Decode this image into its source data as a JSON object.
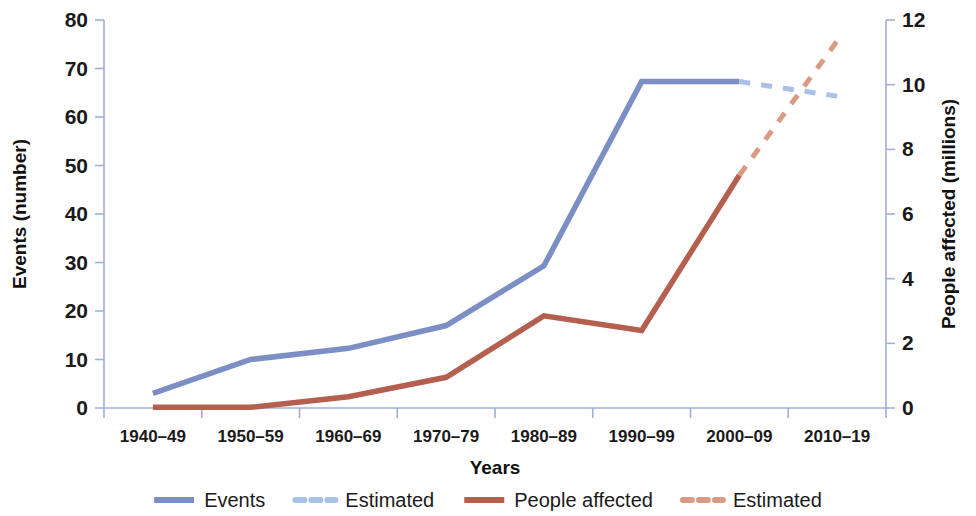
{
  "chart_data": {
    "type": "line",
    "title": "",
    "xlabel": "Years",
    "ylabel": "Events (number)",
    "y2label": "People affected (millions)",
    "categories": [
      "1940–49",
      "1950–59",
      "1960–69",
      "1970–79",
      "1980–89",
      "1990–99",
      "2000–09",
      "2010–19"
    ],
    "ylim": [
      0,
      80
    ],
    "yticks": [
      "0",
      "10",
      "20",
      "30",
      "40",
      "50",
      "60",
      "70",
      "80"
    ],
    "ytick_values": [
      0,
      10,
      20,
      30,
      40,
      50,
      60,
      70,
      80
    ],
    "y2lim": [
      0,
      12
    ],
    "y2ticks": [
      "0",
      "2",
      "4",
      "6",
      "8",
      "10",
      "12"
    ],
    "y2tick_values": [
      0,
      2,
      4,
      6,
      8,
      10,
      12
    ],
    "grid": false,
    "legend_position": "bottom",
    "series": [
      {
        "name": "Events",
        "axis": "left",
        "style": "solid",
        "color": "#7b8fc4",
        "x": [
          "1940–49",
          "1950–59",
          "1960–69",
          "1970–79",
          "1980–89",
          "1990–99",
          "2000–09"
        ],
        "values": [
          3,
          10,
          12.3,
          17,
          29.3,
          67.3,
          67.3
        ]
      },
      {
        "name": "Estimated",
        "axis": "left",
        "style": "dashed",
        "color": "#a9c1e6",
        "x": [
          "2000–09",
          "2010–19"
        ],
        "values": [
          67.3,
          64.3
        ]
      },
      {
        "name": "People affected",
        "axis": "right",
        "style": "solid",
        "color": "#b5604f",
        "x": [
          "1940–49",
          "1950–59",
          "1960–69",
          "1970–79",
          "1980–89",
          "1990–99",
          "2000–09"
        ],
        "values": [
          0.02,
          0.02,
          0.35,
          0.95,
          2.85,
          2.4,
          7.2
        ]
      },
      {
        "name": "Estimated",
        "axis": "right",
        "style": "dashed",
        "color": "#d99b84",
        "x": [
          "2000–09",
          "2010–19"
        ],
        "values": [
          7.2,
          11.35
        ]
      }
    ],
    "legend": [
      {
        "label": "Events",
        "color": "#7b8fc4",
        "style": "solid"
      },
      {
        "label": "Estimated",
        "color": "#a9c1e6",
        "style": "dashed"
      },
      {
        "label": "People affected",
        "color": "#b5604f",
        "style": "solid"
      },
      {
        "label": "Estimated",
        "color": "#d99b84",
        "style": "dashed"
      }
    ]
  },
  "colors": {
    "events": "#7b8fc4",
    "events_estimated": "#a9c1e6",
    "people": "#b5604f",
    "people_estimated": "#d99b84",
    "axis": "#9fb0d4",
    "text": "#1a1a1a",
    "background": "#ffffff"
  }
}
